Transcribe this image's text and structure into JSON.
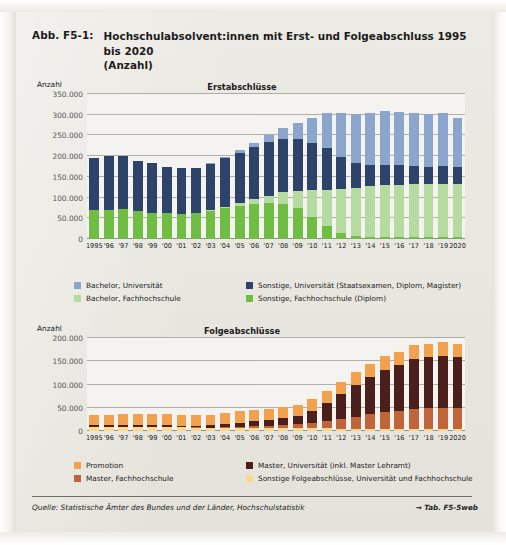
{
  "figure": {
    "label": "Abb. F5-1:",
    "title_line1": "Hochschulabsolvent:innen mit Erst- und Folgeabschluss 1995 bis 2020",
    "title_line2": "(Anzahl)"
  },
  "source": {
    "text": "Quelle: Statistische Ämter des Bundes und der Länder, Hochschulstatistik",
    "table_ref": "→ Tab. F5-5web"
  },
  "colors": {
    "bachelor_uni": "#8ba5cc",
    "sonstige_uni": "#2e4369",
    "bachelor_fh": "#b6dba0",
    "sonstige_fh": "#70bd44",
    "promotion": "#f2a24e",
    "master_uni": "#4a1f1c",
    "master_fh": "#c0653a",
    "sonstige_folge": "#fad98a",
    "grid": "#9a9a93",
    "text": "#1d1d1d",
    "paper": "#e9e8e2"
  },
  "chart_data": [
    {
      "type": "bar",
      "stacked": true,
      "title": "Erstabschlüsse",
      "xlabel": "",
      "ylabel": "Anzahl",
      "ylim": [
        0,
        350000
      ],
      "yticks": [
        0,
        50000,
        100000,
        150000,
        200000,
        250000,
        300000,
        350000
      ],
      "ytick_labels": [
        "0",
        "50.000",
        "100.000",
        "150.000",
        "200.000",
        "250.000",
        "300.000",
        "350.000"
      ],
      "grid": true,
      "legend_position": "below",
      "categories": [
        "1995",
        "'96",
        "'97",
        "'98",
        "'99",
        "'00",
        "'01",
        "'02",
        "'03",
        "'04",
        "'05",
        "'06",
        "'07",
        "'08",
        "'09",
        "'10",
        "'11",
        "'12",
        "'13",
        "'14",
        "'15",
        "'16",
        "'17",
        "'18",
        "'19",
        "2020"
      ],
      "series": [
        {
          "name": "Sonstige, Fachhochschule (Diplom)",
          "key": "sonstige_fh",
          "color": "#70bd44",
          "values": [
            70000,
            71000,
            72000,
            67000,
            64000,
            62000,
            61000,
            62000,
            68000,
            74000,
            79000,
            84000,
            86000,
            84000,
            74000,
            54000,
            31000,
            14000,
            8000,
            6000,
            5000,
            4500,
            4000,
            4000,
            4000,
            4000
          ]
        },
        {
          "name": "Bachelor, Fachhochschule",
          "key": "bachelor_fh",
          "color": "#b6dba0",
          "values": [
            0,
            0,
            0,
            0,
            0,
            0,
            500,
            1000,
            2000,
            4000,
            7000,
            12000,
            19000,
            29000,
            43000,
            64000,
            88000,
            106000,
            116000,
            122000,
            126000,
            127000,
            128000,
            128000,
            129000,
            129000
          ]
        },
        {
          "name": "Sonstige, Universität (Staatsexamen, Diplom, Magister)",
          "key": "sonstige_uni",
          "color": "#2e4369",
          "values": [
            125000,
            130000,
            128000,
            122000,
            119000,
            112000,
            109000,
            108000,
            112000,
            117000,
            122000,
            126000,
            129000,
            128000,
            124000,
            115000,
            100000,
            78000,
            59000,
            50000,
            47000,
            46000,
            44000,
            43000,
            43000,
            41000
          ]
        },
        {
          "name": "Bachelor, Universität",
          "key": "bachelor_uni",
          "color": "#8ba5cc",
          "values": [
            0,
            0,
            0,
            0,
            0,
            0,
            500,
            1000,
            2000,
            3000,
            6000,
            11000,
            18000,
            27000,
            40000,
            60000,
            85000,
            106000,
            119000,
            126000,
            130000,
            130000,
            129000,
            127000,
            127000,
            117000
          ]
        }
      ],
      "totals": [
        195000,
        201000,
        200000,
        189000,
        183000,
        174000,
        171000,
        172000,
        184000,
        198000,
        214000,
        233000,
        252000,
        268000,
        281000,
        293000,
        304000,
        304000,
        302000,
        304000,
        308000,
        307500,
        305000,
        302000,
        303000,
        291000
      ]
    },
    {
      "type": "bar",
      "stacked": true,
      "title": "Folgeabschlüsse",
      "xlabel": "",
      "ylabel": "Anzahl",
      "ylim": [
        0,
        200000
      ],
      "yticks": [
        0,
        50000,
        100000,
        150000,
        200000
      ],
      "ytick_labels": [
        "0",
        "50.000",
        "100.000",
        "150.000",
        "200.000"
      ],
      "grid": true,
      "legend_position": "below",
      "categories": [
        "1995",
        "'96",
        "'97",
        "'98",
        "'99",
        "'00",
        "'01",
        "'02",
        "'03",
        "'04",
        "'05",
        "'06",
        "'07",
        "'08",
        "'09",
        "'10",
        "'11",
        "'12",
        "'13",
        "'14",
        "'15",
        "'16",
        "'17",
        "'18",
        "'19",
        "2020"
      ],
      "series": [
        {
          "name": "Sonstige Folgeabschlüsse, Universität und Fachhochschule",
          "key": "sonstige_folge",
          "color": "#fad98a",
          "values": [
            9000,
            9000,
            9000,
            9000,
            9000,
            9000,
            8000,
            7000,
            6000,
            6000,
            6000,
            6000,
            6000,
            6000,
            6000,
            5500,
            5500,
            5000,
            5000,
            5000,
            5000,
            5000,
            5000,
            5000,
            5000,
            5000
          ]
        },
        {
          "name": "Master, Fachhochschule",
          "key": "master_fh",
          "color": "#c0653a",
          "values": [
            0,
            0,
            0,
            0,
            0,
            0,
            500,
            800,
            1200,
            2000,
            3000,
            4000,
            5500,
            7000,
            9000,
            12000,
            16000,
            21000,
            26000,
            31000,
            36000,
            39000,
            42000,
            44000,
            45000,
            45000
          ]
        },
        {
          "name": "Master, Universität (inkl. Master Lehramt)",
          "key": "master_uni",
          "color": "#4a1f1c",
          "values": [
            3000,
            3000,
            3000,
            3000,
            3000,
            3000,
            3000,
            4000,
            5000,
            7000,
            9000,
            11000,
            12000,
            14000,
            17000,
            25000,
            38000,
            53000,
            67000,
            80000,
            90000,
            98000,
            108000,
            110000,
            112000,
            109000
          ]
        },
        {
          "name": "Promotion",
          "key": "promotion",
          "color": "#f2a24e",
          "values": [
            22000,
            23000,
            24000,
            24000,
            24000,
            25000,
            24000,
            23000,
            23000,
            23000,
            26000,
            25000,
            24000,
            25000,
            25000,
            26000,
            27000,
            27000,
            28000,
            28000,
            30000,
            29000,
            29000,
            28000,
            29000,
            28000
          ]
        }
      ],
      "totals": [
        34000,
        35000,
        36000,
        36000,
        36000,
        37000,
        35500,
        34800,
        35200,
        38000,
        44000,
        46000,
        47500,
        52000,
        57000,
        68500,
        86500,
        106000,
        126000,
        144000,
        161000,
        171000,
        184000,
        187000,
        191000,
        187000
      ]
    }
  ],
  "legend1": [
    {
      "label": "Bachelor, Universität",
      "color_key": "bachelor_uni"
    },
    {
      "label": "Sonstige, Universität (Staatsexamen, Diplom, Magister)",
      "color_key": "sonstige_uni"
    },
    {
      "label": "Bachelor, Fachhochschule",
      "color_key": "bachelor_fh"
    },
    {
      "label": "Sonstige, Fachhochschule (Diplom)",
      "color_key": "sonstige_fh"
    }
  ],
  "legend2": [
    {
      "label": "Promotion",
      "color_key": "promotion"
    },
    {
      "label": "Master, Universität (inkl. Master Lehramt)",
      "color_key": "master_uni"
    },
    {
      "label": "Master, Fachhochschule",
      "color_key": "master_fh"
    },
    {
      "label": "Sonstige Folgeabschlüsse, Universität und Fachhochschule",
      "color_key": "sonstige_folge"
    }
  ]
}
